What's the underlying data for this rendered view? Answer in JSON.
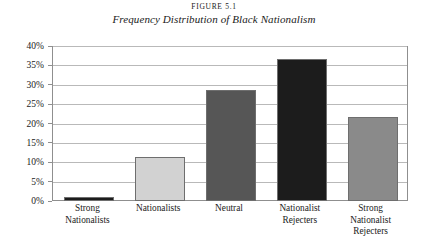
{
  "figure": {
    "number": "FIGURE 5.1",
    "caption": "Frequency Distribution of Black Nationalism"
  },
  "chart_data": {
    "type": "bar",
    "title": "Frequency Distribution of Black Nationalism",
    "subtitle": "FIGURE 5.1",
    "categories": [
      "Strong Nationalists",
      "Nationalists",
      "Neutral",
      "Nationalist Rejecters",
      "Strong Nationalist Rejecters"
    ],
    "category_lines": [
      [
        "Strong",
        "Nationalists"
      ],
      [
        "Nationalists"
      ],
      [
        "Neutral"
      ],
      [
        "Nationalist",
        "Rejecters"
      ],
      [
        "Strong",
        "Nationalist",
        "Rejecters"
      ]
    ],
    "values": [
      1,
      11.5,
      29,
      37,
      22
    ],
    "value_labels": [
      "1%",
      "11.5%",
      "29%",
      "37%",
      "22%"
    ],
    "bar_colors": [
      "#1c1c1c",
      "#d2d2d2",
      "#565656",
      "#1c1c1c",
      "#8a8a8a"
    ],
    "bar_border_color": "#6e6e6e",
    "xlabel": "",
    "ylabel": "",
    "ylim": [
      0,
      40
    ],
    "ytick_values": [
      0,
      5,
      10,
      15,
      20,
      25,
      30,
      35,
      40
    ],
    "ytick_labels": [
      "0%",
      "5%",
      "10%",
      "15%",
      "20%",
      "25%",
      "30%",
      "35%",
      "40%"
    ],
    "grid": true,
    "gridline_color": "#b9b9b9",
    "axis_color": "#8f8f8f",
    "legend": null,
    "legend_position": "none",
    "background": "#ffffff"
  }
}
